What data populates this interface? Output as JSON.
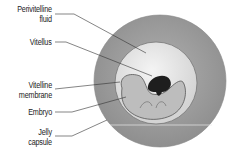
{
  "diagram": {
    "labels": [
      {
        "id": "perivitelline-fluid",
        "line1": "Perivitelline",
        "line2": "fluid"
      },
      {
        "id": "vitellus",
        "line1": "Vitellus"
      },
      {
        "id": "vitelline-membrane",
        "line1": "Vitelline",
        "line2": "membrane"
      },
      {
        "id": "embryo",
        "line1": "Embryo"
      },
      {
        "id": "jelly-capsule",
        "line1": "Jelly",
        "line2": "capsule"
      }
    ],
    "colors": {
      "jelly": "#9a9a9a",
      "fluid": "#e6e6e6",
      "embryo": "#bdbdbd",
      "vitellus": "#1e1e1e",
      "line": "#333333"
    }
  }
}
